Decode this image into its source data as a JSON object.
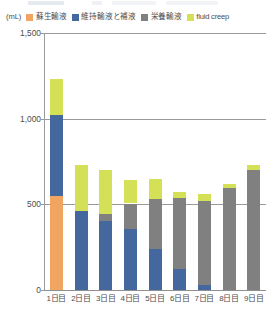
{
  "chart_data": {
    "type": "bar",
    "stacked": true,
    "title": "",
    "subtitle": "",
    "xlabel": "",
    "ylabel": "",
    "unit_label": "(mL)",
    "ylim": [
      0,
      1500
    ],
    "yticks": [
      0,
      500,
      1000,
      1500
    ],
    "ytick_labels": [
      "0",
      "500",
      "1,000",
      "1,500"
    ],
    "grid": true,
    "legend_position": "top",
    "categories": [
      "1日目",
      "2日目",
      "3日目",
      "4日目",
      "5日目",
      "6日目",
      "7日目",
      "8日目",
      "9日目"
    ],
    "series": [
      {
        "name": "蘇生輸液",
        "color": "#F0A560",
        "values": [
          550,
          0,
          0,
          0,
          0,
          0,
          0,
          0,
          0
        ]
      },
      {
        "name": "維持輸液と補液",
        "color": "#44689E",
        "values": [
          470,
          460,
          400,
          355,
          240,
          125,
          30,
          0,
          0
        ]
      },
      {
        "name": "栄養輸液",
        "color": "#808080",
        "values": [
          0,
          0,
          45,
          150,
          290,
          410,
          490,
          595,
          700
        ]
      },
      {
        "name": "fluid creep",
        "color": "#D4E157",
        "values": [
          210,
          270,
          255,
          140,
          120,
          40,
          40,
          25,
          30
        ]
      }
    ],
    "totals": [
      1230,
      730,
      700,
      645,
      650,
      575,
      560,
      620,
      730
    ]
  },
  "legend": {
    "unit": "(mL)",
    "items": [
      {
        "label": "蘇生輸液",
        "color": "#F0A560"
      },
      {
        "label": "維持輸液と補液",
        "color": "#44689E"
      },
      {
        "label": "栄養輸液",
        "color": "#808080"
      },
      {
        "label": "fluid creep",
        "color": "#D4E157"
      }
    ]
  }
}
